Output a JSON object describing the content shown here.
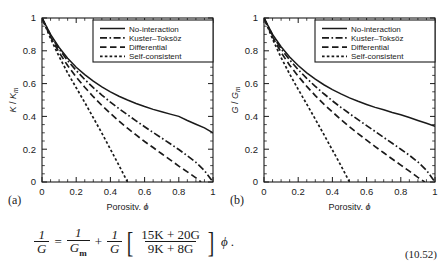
{
  "figure": {
    "panels": [
      {
        "letter": "(a)",
        "ylabel_main": "K",
        "ylabel_sub": "K",
        "ylabel_subscript": "m",
        "xlabel": "Porosity, ",
        "xlabel_symbol": "ϕ"
      },
      {
        "letter": "(b)",
        "ylabel_main": "G",
        "ylabel_sub": "G",
        "ylabel_subscript": "m",
        "xlabel": "Porosity, ",
        "xlabel_symbol": "ϕ"
      }
    ],
    "legend": [
      {
        "label": "No-interaction",
        "style": "solid"
      },
      {
        "label": "Kuster–Toksöz",
        "style": "dash-dot"
      },
      {
        "label": "Differential",
        "style": "long-dash"
      },
      {
        "label": "Self-consistent",
        "style": "short-dash"
      }
    ],
    "tick_labels": [
      "0",
      "0.2",
      "0.4",
      "0.6",
      "0.8",
      "1"
    ],
    "line_color": "#1a1a1a"
  },
  "equation": {
    "lhs_num": "1",
    "lhs_den": "G",
    "equals": "=",
    "t1_num": "1",
    "t1_den": "G",
    "t1_den_sub": "m",
    "plus": "+",
    "t2_num": "1",
    "t2_den": "G",
    "bracket_open": "[",
    "bracket_num": "15K + 20G",
    "bracket_den": "9K + 8G",
    "bracket_close": "]",
    "phi": "ϕ",
    "period": ".",
    "number": "(10.52)"
  },
  "chart_data": [
    {
      "type": "line",
      "title": "",
      "panel": "(a)",
      "xlabel": "Porosity, ϕ",
      "ylabel": "K / K_m",
      "xlim": [
        0,
        1
      ],
      "ylim": [
        0,
        1
      ],
      "xticks": [
        0,
        0.2,
        0.4,
        0.6,
        0.8,
        1
      ],
      "yticks": [
        0,
        0.2,
        0.4,
        0.6,
        0.8,
        1
      ],
      "grid": false,
      "legend_position": "top-right",
      "series": [
        {
          "name": "No-interaction",
          "style": "solid",
          "x": [
            0,
            0.05,
            0.1,
            0.15,
            0.2,
            0.25,
            0.3,
            0.35,
            0.4,
            0.45,
            0.5,
            0.55,
            0.6,
            0.65,
            0.7,
            0.75,
            0.8,
            0.85,
            0.9,
            0.95,
            1.0
          ],
          "y": [
            1.0,
            0.9,
            0.82,
            0.755,
            0.7,
            0.655,
            0.615,
            0.58,
            0.55,
            0.523,
            0.5,
            0.479,
            0.46,
            0.443,
            0.428,
            0.414,
            0.4,
            0.375,
            0.352,
            0.33,
            0.3
          ]
        },
        {
          "name": "Kuster–Toksöz",
          "style": "dash-dot",
          "x": [
            0,
            0.05,
            0.1,
            0.15,
            0.2,
            0.25,
            0.3,
            0.35,
            0.4,
            0.45,
            0.5,
            0.55,
            0.6,
            0.65,
            0.7,
            0.75,
            0.8,
            0.85,
            0.9,
            0.95,
            1.0
          ],
          "y": [
            1.0,
            0.895,
            0.81,
            0.74,
            0.68,
            0.625,
            0.575,
            0.53,
            0.487,
            0.447,
            0.41,
            0.373,
            0.337,
            0.302,
            0.268,
            0.233,
            0.198,
            0.16,
            0.12,
            0.07,
            0.0
          ]
        },
        {
          "name": "Differential",
          "style": "long-dash",
          "x": [
            0,
            0.05,
            0.1,
            0.15,
            0.2,
            0.25,
            0.3,
            0.35,
            0.4,
            0.45,
            0.5,
            0.55,
            0.6,
            0.65,
            0.7,
            0.75,
            0.8,
            0.85,
            0.9,
            0.93
          ],
          "y": [
            1.0,
            0.885,
            0.79,
            0.71,
            0.64,
            0.578,
            0.52,
            0.467,
            0.418,
            0.372,
            0.328,
            0.287,
            0.247,
            0.21,
            0.172,
            0.135,
            0.097,
            0.062,
            0.025,
            0.0
          ]
        },
        {
          "name": "Self-consistent",
          "style": "short-dash",
          "x": [
            0,
            0.05,
            0.1,
            0.15,
            0.2,
            0.25,
            0.3,
            0.35,
            0.4,
            0.45,
            0.5
          ],
          "y": [
            1.0,
            0.875,
            0.765,
            0.665,
            0.575,
            0.485,
            0.392,
            0.298,
            0.2,
            0.102,
            0.0
          ]
        }
      ]
    },
    {
      "type": "line",
      "title": "",
      "panel": "(b)",
      "xlabel": "Porosity, ϕ",
      "ylabel": "G / G_m",
      "xlim": [
        0,
        1
      ],
      "ylim": [
        0,
        1
      ],
      "xticks": [
        0,
        0.2,
        0.4,
        0.6,
        0.8,
        1
      ],
      "yticks": [
        0,
        0.2,
        0.4,
        0.6,
        0.8,
        1
      ],
      "grid": false,
      "legend_position": "top-right",
      "series": [
        {
          "name": "No-interaction",
          "style": "solid",
          "x": [
            0,
            0.05,
            0.1,
            0.15,
            0.2,
            0.25,
            0.3,
            0.35,
            0.4,
            0.45,
            0.5,
            0.55,
            0.6,
            0.65,
            0.7,
            0.75,
            0.8,
            0.85,
            0.9,
            0.95,
            1.0
          ],
          "y": [
            1.0,
            0.9,
            0.825,
            0.762,
            0.71,
            0.665,
            0.627,
            0.593,
            0.563,
            0.537,
            0.513,
            0.492,
            0.473,
            0.455,
            0.44,
            0.424,
            0.41,
            0.393,
            0.375,
            0.358,
            0.34
          ]
        },
        {
          "name": "Kuster–Toksöz",
          "style": "dash-dot",
          "x": [
            0,
            0.05,
            0.1,
            0.15,
            0.2,
            0.25,
            0.3,
            0.35,
            0.4,
            0.45,
            0.5,
            0.55,
            0.6,
            0.65,
            0.7,
            0.75,
            0.8,
            0.85,
            0.9,
            0.95,
            1.0
          ],
          "y": [
            1.0,
            0.895,
            0.812,
            0.745,
            0.685,
            0.632,
            0.583,
            0.538,
            0.495,
            0.455,
            0.417,
            0.38,
            0.344,
            0.308,
            0.272,
            0.236,
            0.2,
            0.163,
            0.122,
            0.072,
            0.0
          ]
        },
        {
          "name": "Differential",
          "style": "long-dash",
          "x": [
            0,
            0.05,
            0.1,
            0.15,
            0.2,
            0.25,
            0.3,
            0.35,
            0.4,
            0.45,
            0.5,
            0.55,
            0.6,
            0.65,
            0.7,
            0.75,
            0.8,
            0.85,
            0.9,
            0.94
          ],
          "y": [
            1.0,
            0.885,
            0.79,
            0.712,
            0.645,
            0.583,
            0.527,
            0.475,
            0.427,
            0.381,
            0.337,
            0.295,
            0.255,
            0.216,
            0.178,
            0.14,
            0.103,
            0.066,
            0.028,
            0.0
          ]
        },
        {
          "name": "Self-consistent",
          "style": "short-dash",
          "x": [
            0,
            0.05,
            0.1,
            0.15,
            0.2,
            0.25,
            0.3,
            0.35,
            0.4,
            0.45,
            0.5
          ],
          "y": [
            1.0,
            0.872,
            0.758,
            0.658,
            0.565,
            0.475,
            0.383,
            0.29,
            0.195,
            0.1,
            0.0
          ]
        }
      ]
    }
  ]
}
